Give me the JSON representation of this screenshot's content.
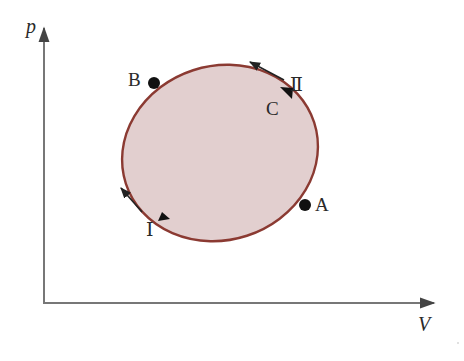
{
  "diagram": {
    "type": "p-V cycle diagram",
    "axes": {
      "y_label": "p",
      "x_label": "V"
    },
    "cycle": {
      "shape": "closed ellipse",
      "fill_color": "#e2cfcf",
      "stroke_color": "#8b3a32"
    },
    "points": [
      {
        "id": "A",
        "label": "A"
      },
      {
        "id": "B",
        "label": "B"
      },
      {
        "id": "C",
        "label": "C"
      }
    ],
    "paths": [
      {
        "id": "I",
        "label": "Ⅰ",
        "description": "lower path from A to B (direction arrow up-left)"
      },
      {
        "id": "II",
        "label": "Ⅱ",
        "description": "upper path from B to A via C (direction arrow up-left beside curve)"
      }
    ]
  }
}
